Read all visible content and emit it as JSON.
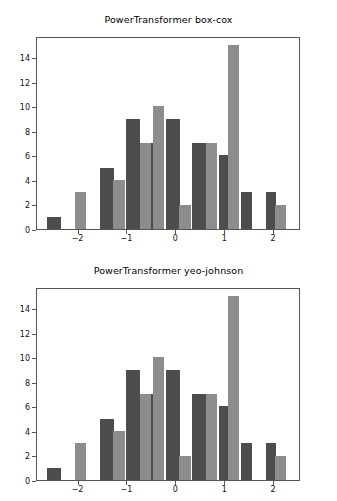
{
  "figure": {
    "width": 337,
    "height": 501,
    "background": "#ffffff",
    "bar_color_dark": "#4d4d4d",
    "bar_color_light": "#8d8d8d",
    "axis_color": "#555555",
    "text_color": "#111111"
  },
  "chart_data": [
    {
      "type": "bar",
      "title": "PowerTransformer box-cox",
      "xlabel": "",
      "ylabel": "",
      "xlim": [
        -2.85,
        2.55
      ],
      "ylim": [
        0,
        15.75
      ],
      "grid": false,
      "legend": "none",
      "xticks": [
        -2,
        -1,
        0,
        1,
        2
      ],
      "xticklabels": [
        "−2",
        "−1",
        "0",
        "1",
        "2"
      ],
      "yticks": [
        0,
        2,
        4,
        6,
        8,
        10,
        12,
        14
      ],
      "yticklabels": [
        "0",
        "2",
        "4",
        "6",
        "8",
        "10",
        "12",
        "14"
      ],
      "series": [
        {
          "name": "dark",
          "color": "#4d4d4d",
          "bars": [
            {
              "x_left": -2.64,
              "x_right": -2.36,
              "value": 1
            },
            {
              "x_left": -1.56,
              "x_right": -1.28,
              "value": 5
            },
            {
              "x_left": -1.02,
              "x_right": -0.74,
              "value": 9
            },
            {
              "x_left": -0.75,
              "x_right": -0.47,
              "value": 7
            },
            {
              "x_left": -0.21,
              "x_right": 0.07,
              "value": 9
            },
            {
              "x_left": 0.33,
              "x_right": 0.61,
              "value": 7
            },
            {
              "x_left": 0.87,
              "x_right": 1.06,
              "value": 6
            },
            {
              "x_left": 1.33,
              "x_right": 1.55,
              "value": 3
            },
            {
              "x_left": 1.83,
              "x_right": 2.03,
              "value": 3
            }
          ]
        },
        {
          "name": "light",
          "color": "#8d8d8d",
          "bars": [
            {
              "x_left": -2.07,
              "x_right": -1.84,
              "value": 3
            },
            {
              "x_left": -1.29,
              "x_right": -1.06,
              "value": 4
            },
            {
              "x_left": -0.75,
              "x_right": -0.52,
              "value": 7
            },
            {
              "x_left": -0.48,
              "x_right": -0.25,
              "value": 10
            },
            {
              "x_left": 0.06,
              "x_right": 0.29,
              "value": 2
            },
            {
              "x_left": 0.6,
              "x_right": 0.83,
              "value": 7
            },
            {
              "x_left": 1.05,
              "x_right": 1.28,
              "value": 15
            },
            {
              "x_left": 2.02,
              "x_right": 2.25,
              "value": 2
            }
          ]
        }
      ]
    },
    {
      "type": "bar",
      "title": "PowerTransformer yeo-johnson",
      "xlabel": "",
      "ylabel": "",
      "xlim": [
        -2.85,
        2.55
      ],
      "ylim": [
        0,
        15.75
      ],
      "grid": false,
      "legend": "none",
      "xticks": [
        -2,
        -1,
        0,
        1,
        2
      ],
      "xticklabels": [
        "−2",
        "−1",
        "0",
        "1",
        "2"
      ],
      "yticks": [
        0,
        2,
        4,
        6,
        8,
        10,
        12,
        14
      ],
      "yticklabels": [
        "0",
        "2",
        "4",
        "6",
        "8",
        "10",
        "12",
        "14"
      ],
      "series": [
        {
          "name": "dark",
          "color": "#4d4d4d",
          "bars": [
            {
              "x_left": -2.64,
              "x_right": -2.36,
              "value": 1
            },
            {
              "x_left": -1.56,
              "x_right": -1.28,
              "value": 5
            },
            {
              "x_left": -1.02,
              "x_right": -0.74,
              "value": 9
            },
            {
              "x_left": -0.75,
              "x_right": -0.47,
              "value": 7
            },
            {
              "x_left": -0.21,
              "x_right": 0.07,
              "value": 9
            },
            {
              "x_left": 0.33,
              "x_right": 0.61,
              "value": 7
            },
            {
              "x_left": 0.87,
              "x_right": 1.06,
              "value": 6
            },
            {
              "x_left": 1.33,
              "x_right": 1.55,
              "value": 3
            },
            {
              "x_left": 1.83,
              "x_right": 2.03,
              "value": 3
            }
          ]
        },
        {
          "name": "light",
          "color": "#8d8d8d",
          "bars": [
            {
              "x_left": -2.07,
              "x_right": -1.84,
              "value": 3
            },
            {
              "x_left": -1.29,
              "x_right": -1.06,
              "value": 4
            },
            {
              "x_left": -0.75,
              "x_right": -0.52,
              "value": 7
            },
            {
              "x_left": -0.48,
              "x_right": -0.25,
              "value": 10
            },
            {
              "x_left": 0.06,
              "x_right": 0.29,
              "value": 2
            },
            {
              "x_left": 0.6,
              "x_right": 0.83,
              "value": 7
            },
            {
              "x_left": 1.05,
              "x_right": 1.28,
              "value": 15
            },
            {
              "x_left": 2.02,
              "x_right": 2.25,
              "value": 2
            }
          ]
        }
      ]
    }
  ]
}
